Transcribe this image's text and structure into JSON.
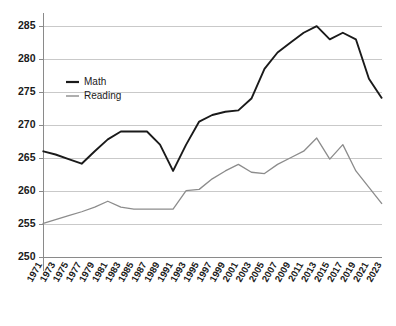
{
  "chart_data": {
    "type": "line",
    "title": "",
    "subtitle": "",
    "xlabel": "",
    "ylabel": "",
    "xlim": [
      1971,
      2023
    ],
    "ylim": [
      250,
      287
    ],
    "yticks": [
      250,
      255,
      260,
      265,
      270,
      275,
      280,
      285
    ],
    "grid": true,
    "grid_axis": "y",
    "legend_position": "upper-left-inside",
    "x": [
      1971,
      1973,
      1975,
      1977,
      1979,
      1981,
      1983,
      1985,
      1987,
      1989,
      1991,
      1993,
      1995,
      1997,
      1999,
      2001,
      2003,
      2005,
      2007,
      2009,
      2011,
      2013,
      2015,
      2017,
      2019,
      2021,
      2023
    ],
    "xticklabels": [
      "1971",
      "1973",
      "1975",
      "1977",
      "1979",
      "1981",
      "1983",
      "1985",
      "1987",
      "1989",
      "1991",
      "1993",
      "1995",
      "1997",
      "1999",
      "2001",
      "2003",
      "2005",
      "2007",
      "2009",
      "2011",
      "2013",
      "2015",
      "2017",
      "2019",
      "2021",
      "2023"
    ],
    "series": [
      {
        "name": "Math",
        "color": "#1a1a1a",
        "width": 1.9,
        "values": [
          266.0,
          265.5,
          264.8,
          264.1,
          266.0,
          267.8,
          269.0,
          269.0,
          269.0,
          267.0,
          263.0,
          267.0,
          270.5,
          271.5,
          272.0,
          272.2,
          274.0,
          278.5,
          281.0,
          282.5,
          284.0,
          285.0,
          283.0,
          284.0,
          283.0,
          277.0,
          274.0
        ]
      },
      {
        "name": "Reading",
        "color": "#8c8c8c",
        "width": 1.3,
        "values": [
          255.0,
          255.6,
          256.2,
          256.8,
          257.5,
          258.4,
          257.5,
          257.2,
          257.2,
          257.2,
          257.2,
          260.0,
          260.2,
          261.8,
          263.0,
          264.0,
          262.8,
          262.6,
          264.0,
          265.0,
          266.0,
          268.0,
          264.8,
          267.0,
          263.0,
          260.5,
          258.0
        ]
      }
    ]
  },
  "legend": {
    "items": [
      {
        "label": "Math",
        "color": "#1a1a1a"
      },
      {
        "label": "Reading",
        "color": "#8c8c8c"
      }
    ]
  }
}
